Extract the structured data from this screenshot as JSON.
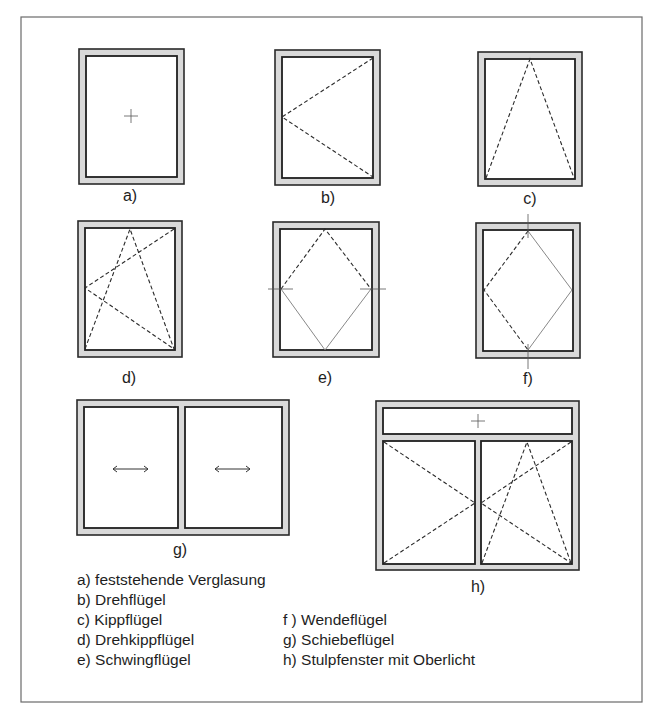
{
  "figure": {
    "colors": {
      "frame_fill": "#d9d9d9",
      "line": "#1f1f1f",
      "border": "#6a6a6a",
      "background": "#ffffff"
    },
    "panels": [
      {
        "id": "a",
        "label": "a)"
      },
      {
        "id": "b",
        "label": "b)"
      },
      {
        "id": "c",
        "label": "c)"
      },
      {
        "id": "d",
        "label": "d)"
      },
      {
        "id": "e",
        "label": "e)"
      },
      {
        "id": "f",
        "label": "f)"
      },
      {
        "id": "g",
        "label": "g)"
      },
      {
        "id": "h",
        "label": "h)"
      }
    ]
  },
  "legend": {
    "left": [
      "a) feststehende Verglasung",
      "b) Drehflügel",
      "c) Kippflügel",
      "d) Drehkippflügel",
      "e) Schwingflügel"
    ],
    "right": [
      "f ) Wendeflügel",
      "g) Schiebeflügel",
      "h) Stulpfenster mit Oberlicht"
    ]
  }
}
